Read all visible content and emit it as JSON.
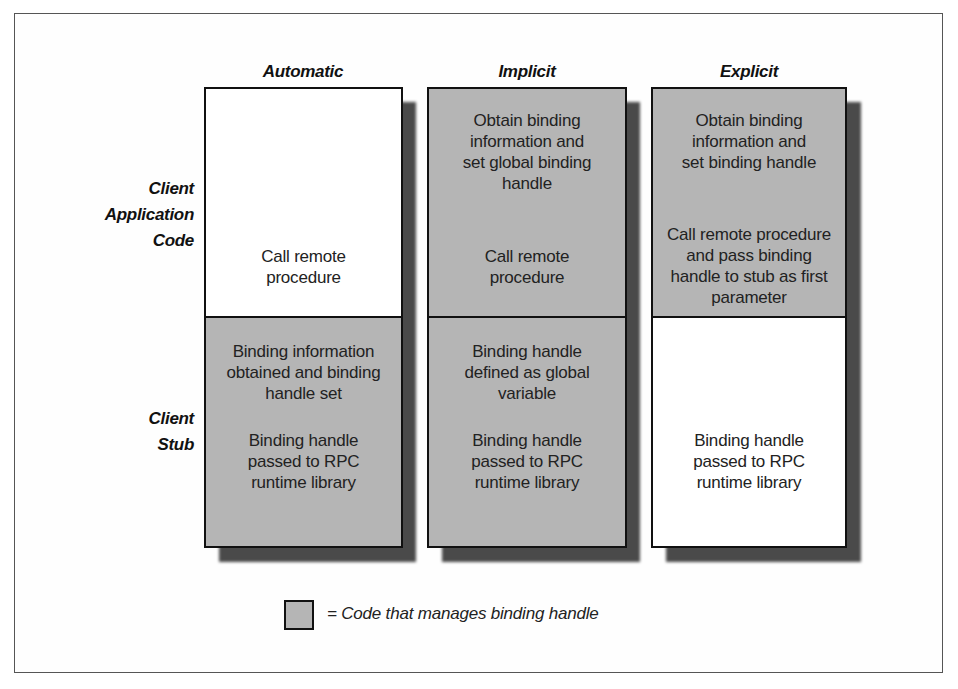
{
  "diagram": {
    "columns": [
      {
        "title": "Automatic",
        "client_application_code": {
          "shaded": false,
          "texts": [
            "Call remote\nprocedure"
          ]
        },
        "client_stub": {
          "shaded": true,
          "texts": [
            "Binding information\nobtained and binding\nhandle set",
            "Binding handle\npassed to RPC\nruntime library"
          ]
        }
      },
      {
        "title": "Implicit",
        "client_application_code": {
          "shaded": true,
          "texts": [
            "Obtain binding\ninformation and\nset global binding\nhandle",
            "Call remote\nprocedure"
          ]
        },
        "client_stub": {
          "shaded": true,
          "texts": [
            "Binding handle\ndefined as global\nvariable",
            "Binding handle\npassed to RPC\nruntime library"
          ]
        }
      },
      {
        "title": "Explicit",
        "client_application_code": {
          "shaded": true,
          "texts": [
            "Obtain binding\ninformation and\nset binding handle",
            "Call remote procedure\nand pass binding\nhandle to stub as first\nparameter"
          ]
        },
        "client_stub": {
          "shaded": false,
          "texts": [
            "Binding handle\npassed to RPC\nruntime library"
          ]
        }
      }
    ],
    "row_labels": {
      "client_application_code": "Client\nApplication\nCode",
      "client_stub": "Client\nStub"
    },
    "legend": {
      "text": "= Code that manages binding handle",
      "swatch_color": "#b5b5b5"
    },
    "colors": {
      "shaded": "#b5b5b5",
      "unshaded": "#ffffff",
      "border": "#111111",
      "shadow": "#4a4a4a"
    }
  }
}
